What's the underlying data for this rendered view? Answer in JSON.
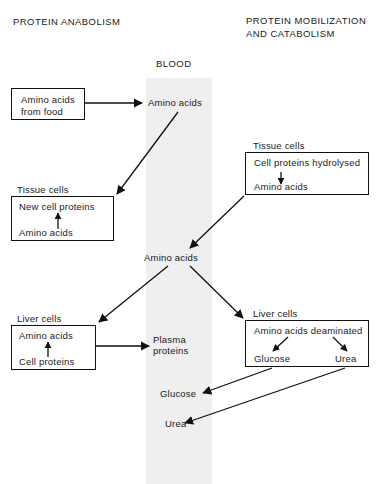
{
  "diagram": {
    "title_left": "PROTEIN ANABOLISM",
    "title_right": "PROTEIN MOBILIZATION\nAND CATABOLISM",
    "compartment_label": "BLOOD",
    "compartment_color": "#efefef"
  },
  "boxes": {
    "amino_acids_from_food": {
      "line1": "Amino acids",
      "line2": "from food"
    },
    "tissue_cells_left": {
      "label": "Tissue cells",
      "line1": "New cell proteins",
      "line2": "Amino acids"
    },
    "liver_cells_left": {
      "label": "Liver cells",
      "line1": "Amino acids",
      "line2": "Cell proteins"
    },
    "tissue_cells_right": {
      "label": "Tissue cells",
      "line1": "Cell proteins hydrolysed",
      "line2": "Amino acids"
    },
    "liver_cells_right": {
      "label": "Liver cells",
      "line1": "Amino acids deaminated",
      "line2_left": "Glucose",
      "line2_right": "Urea"
    }
  },
  "blood_items": {
    "amino_acids_top": "Amino acids",
    "amino_acids_mid": "Amino acids",
    "plasma_proteins": "Plasma\nproteins",
    "glucose": "Glucose",
    "urea": "Urea"
  }
}
